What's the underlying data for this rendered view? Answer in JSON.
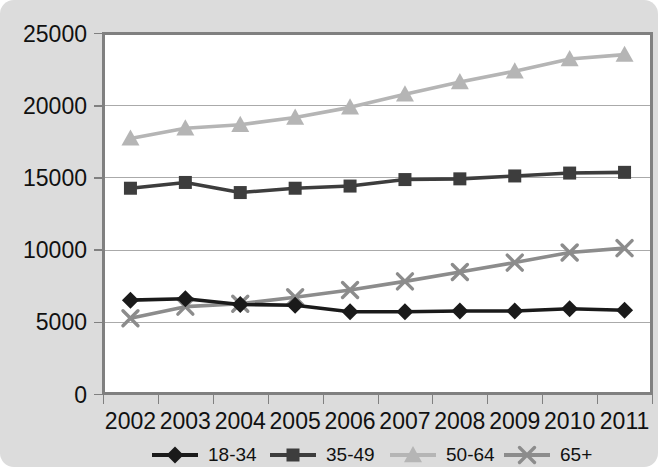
{
  "chart_data": {
    "type": "line",
    "title": "",
    "xlabel": "",
    "ylabel": "",
    "categories": [
      "2002",
      "2003",
      "2004",
      "2005",
      "2006",
      "2007",
      "2008",
      "2009",
      "2010",
      "2011"
    ],
    "ylim": [
      0,
      25000
    ],
    "ytick_labels": [
      "0",
      "5000",
      "10000",
      "15000",
      "20000",
      "25000"
    ],
    "ytick_values": [
      0,
      5000,
      10000,
      15000,
      20000,
      25000
    ],
    "grid": true,
    "legend_position": "bottom",
    "series": [
      {
        "name": "18-34",
        "marker": "diamond",
        "color": "#1a1a1a",
        "values": [
          6500,
          6600,
          6200,
          6150,
          5700,
          5700,
          5750,
          5750,
          5900,
          5800
        ]
      },
      {
        "name": "35-49",
        "marker": "square",
        "color": "#3d3d3d",
        "values": [
          14250,
          14650,
          13950,
          14250,
          14400,
          14850,
          14900,
          15100,
          15300,
          15350
        ]
      },
      {
        "name": "50-64",
        "marker": "triangle",
        "color": "#b5b5b5",
        "values": [
          17700,
          18400,
          18650,
          19150,
          19850,
          20750,
          21600,
          22350,
          23200,
          23500
        ]
      },
      {
        "name": "65+",
        "marker": "x",
        "color": "#8c8c8c",
        "values": [
          5250,
          6050,
          6250,
          6700,
          7200,
          7800,
          8450,
          9100,
          9800,
          10100
        ]
      }
    ]
  },
  "legend": {
    "items": [
      {
        "label": "18-34"
      },
      {
        "label": "35-49"
      },
      {
        "label": "50-64"
      },
      {
        "label": "65+"
      }
    ]
  },
  "colors": {
    "background": "#dcdcdc",
    "plot_background": "#ffffff",
    "gridline": "#aaaaaa",
    "axis": "#808080",
    "text": "#111111"
  }
}
